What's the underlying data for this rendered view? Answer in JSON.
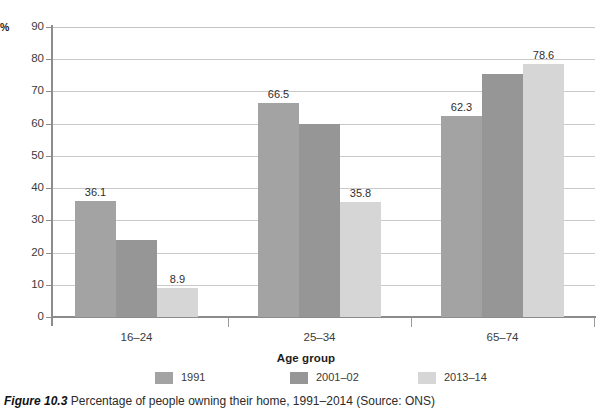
{
  "figure": {
    "number": "Figure 10.3",
    "caption": "Percentage of people owning their home, 1991–2014 (Source: ONS)"
  },
  "axis": {
    "y_unit": "%",
    "x_title": "Age group",
    "y_ticks": [
      "90",
      "80",
      "70",
      "60",
      "50",
      "40",
      "30",
      "20",
      "10",
      "0"
    ]
  },
  "legend": {
    "items": [
      {
        "label": "1991",
        "color": "#a3a3a3"
      },
      {
        "label": "2001–02",
        "color": "#969696"
      },
      {
        "label": "2013–14",
        "color": "#d6d6d6"
      }
    ]
  },
  "chart_data": {
    "type": "bar",
    "title": "Percentage of people owning their home, 1991–2014",
    "xlabel": "Age group",
    "ylabel": "%",
    "ylim": [
      0,
      90
    ],
    "ytick_step": 10,
    "grid": true,
    "legend_position": "bottom",
    "categories": [
      "16–24",
      "25–34",
      "65–74"
    ],
    "series": [
      {
        "name": "1991",
        "color": "#a3a3a3",
        "values": [
          36.1,
          66.5,
          62.3
        ],
        "labels": [
          "36.1",
          "66.5",
          "62.3"
        ]
      },
      {
        "name": "2001–02",
        "color": "#969696",
        "values": [
          24.0,
          60.0,
          75.5
        ],
        "labels": [
          "",
          "",
          ""
        ]
      },
      {
        "name": "2013–14",
        "color": "#d6d6d6",
        "values": [
          8.9,
          35.8,
          78.6
        ],
        "labels": [
          "8.9",
          "35.8",
          "78.6"
        ]
      }
    ],
    "source": "ONS"
  }
}
